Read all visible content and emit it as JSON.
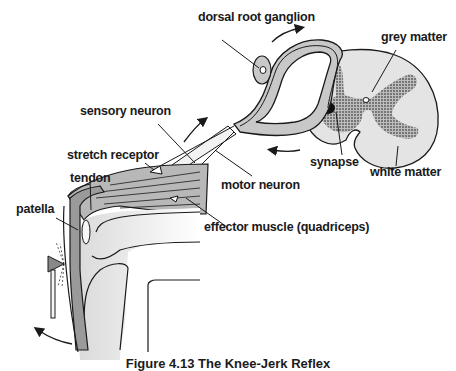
{
  "figure": {
    "caption": "Figure 4.13   The Knee-Jerk Reflex",
    "labels": {
      "dorsal_root_ganglion": "dorsal root ganglion",
      "grey_matter": "grey matter",
      "sensory_neuron": "sensory neuron",
      "stretch_receptor": "stretch receptor",
      "tendon": "tendon",
      "patella": "patella",
      "synapse": "synapse",
      "white_matter": "white matter",
      "motor_neuron": "motor neuron",
      "effector_muscle": "effector muscle (quadriceps)"
    },
    "colors": {
      "line": "#1a1a1a",
      "grey_fill": "#c8c8c8",
      "dark_fill": "#7a7a7a",
      "light_fill": "#e6e6e6"
    }
  }
}
